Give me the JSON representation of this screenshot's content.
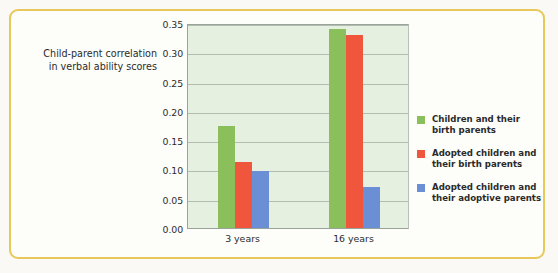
{
  "chart_data": {
    "type": "bar",
    "title": "",
    "xlabel": "",
    "ylabel": "Child-parent correlation in verbal ability scores",
    "ylabel_lines": [
      "Child-parent correlation",
      "in verbal ability scores"
    ],
    "categories": [
      "3 years",
      "16 years"
    ],
    "series": [
      {
        "name": "Children and their birth parents",
        "name_lines": [
          "Children and their",
          "birth parents"
        ],
        "color": "#8bbf5c",
        "values": [
          0.175,
          0.34
        ]
      },
      {
        "name": "Adopted children and their birth parents",
        "name_lines": [
          "Adopted children and",
          "their birth parents"
        ],
        "color": "#f0563c",
        "values": [
          0.113,
          0.33
        ]
      },
      {
        "name": "Adopted children and their adoptive parents",
        "name_lines": [
          "Adopted children and",
          "their adoptive parents"
        ],
        "color": "#6b8fd4",
        "values": [
          0.097,
          0.07
        ]
      }
    ],
    "ylim": [
      0.0,
      0.35
    ],
    "yticks": [
      "0.00",
      "0.05",
      "0.10",
      "0.15",
      "0.20",
      "0.25",
      "0.30",
      "0.35"
    ],
    "ytick_values": [
      0.0,
      0.05,
      0.1,
      0.15,
      0.2,
      0.25,
      0.3,
      0.35
    ],
    "grid": true,
    "legend_position": "right",
    "plot_background": "#e6f0e0",
    "frame_color": "#e8c85a"
  }
}
